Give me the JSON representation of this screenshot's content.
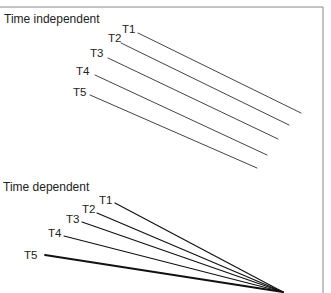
{
  "frame": {
    "top_y": 7,
    "right_x": 323,
    "color": "#888888"
  },
  "panels": [
    {
      "title": "Time independent",
      "title_pos": [
        4,
        12
      ],
      "line_color": "#444444",
      "line_width": 1,
      "lines": [
        {
          "label": "T1",
          "label_pos": [
            122,
            23
          ],
          "from": [
            138,
            33
          ],
          "to": [
            301,
            113
          ]
        },
        {
          "label": "T2",
          "label_pos": [
            108,
            32
          ],
          "from": [
            121,
            43
          ],
          "to": [
            289,
            125
          ]
        },
        {
          "label": "T3",
          "label_pos": [
            90,
            47
          ],
          "from": [
            108,
            58
          ],
          "to": [
            278,
            139
          ]
        },
        {
          "label": "T4",
          "label_pos": [
            76,
            65
          ],
          "from": [
            95,
            75
          ],
          "to": [
            267,
            155
          ]
        },
        {
          "label": "T5",
          "label_pos": [
            73,
            86
          ],
          "from": [
            90,
            95
          ],
          "to": [
            257,
            168
          ]
        }
      ]
    },
    {
      "title": "Time dependent",
      "title_pos": [
        3,
        180
      ],
      "line_color": "#111111",
      "line_width": 1.2,
      "lines": [
        {
          "label": "T1",
          "label_pos": [
            99,
            194
          ],
          "from": [
            115,
            203
          ],
          "to": [
            283,
            292
          ]
        },
        {
          "label": "T2",
          "label_pos": [
            82,
            203
          ],
          "from": [
            97,
            213
          ],
          "to": [
            283,
            292
          ]
        },
        {
          "label": "T3",
          "label_pos": [
            66,
            213
          ],
          "from": [
            82,
            222
          ],
          "to": [
            283,
            292
          ]
        },
        {
          "label": "T4",
          "label_pos": [
            48,
            227
          ],
          "from": [
            64,
            236
          ],
          "to": [
            283,
            292
          ]
        },
        {
          "label": "T5",
          "label_pos": [
            24,
            249
          ],
          "from": [
            45,
            255
          ],
          "to": [
            283,
            292
          ],
          "width": 1.8
        }
      ]
    }
  ]
}
